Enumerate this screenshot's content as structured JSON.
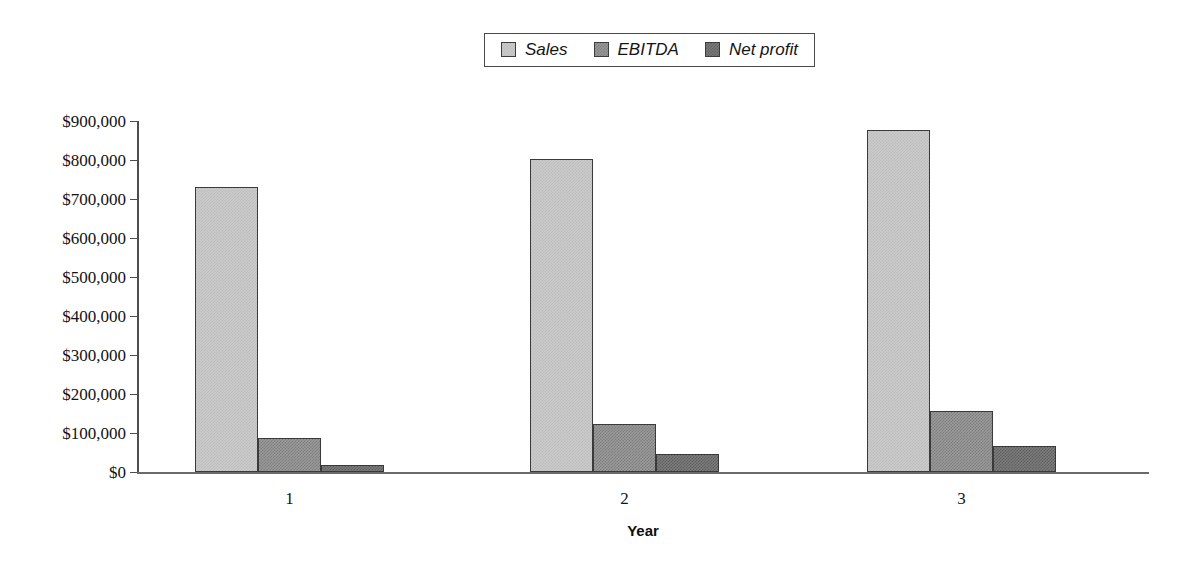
{
  "chart_data": {
    "type": "bar",
    "title": "",
    "xlabel": "Year",
    "ylabel": "",
    "categories": [
      "1",
      "2",
      "3"
    ],
    "series": [
      {
        "name": "Sales",
        "color": "#cbcbcb",
        "values": [
          730000,
          802000,
          876000
        ]
      },
      {
        "name": "EBITDA",
        "color": "#9a9a9a",
        "values": [
          88000,
          122000,
          157000
        ]
      },
      {
        "name": "Net profit",
        "color": "#7b7b7b",
        "values": [
          17000,
          45000,
          66000
        ]
      }
    ],
    "ylim": [
      0,
      900000
    ],
    "ytick_values": [
      0,
      100000,
      200000,
      300000,
      400000,
      500000,
      600000,
      700000,
      800000,
      900000
    ],
    "ytick_labels": [
      "$0",
      "$100,000",
      "$200,000",
      "$300,000",
      "$400,000",
      "$500,000",
      "$600,000",
      "$700,000",
      "$800,000",
      "$900,000"
    ],
    "grid": false,
    "legend_position": "top-center",
    "legend_entries": [
      "Sales",
      "EBITDA",
      "Net profit"
    ]
  }
}
